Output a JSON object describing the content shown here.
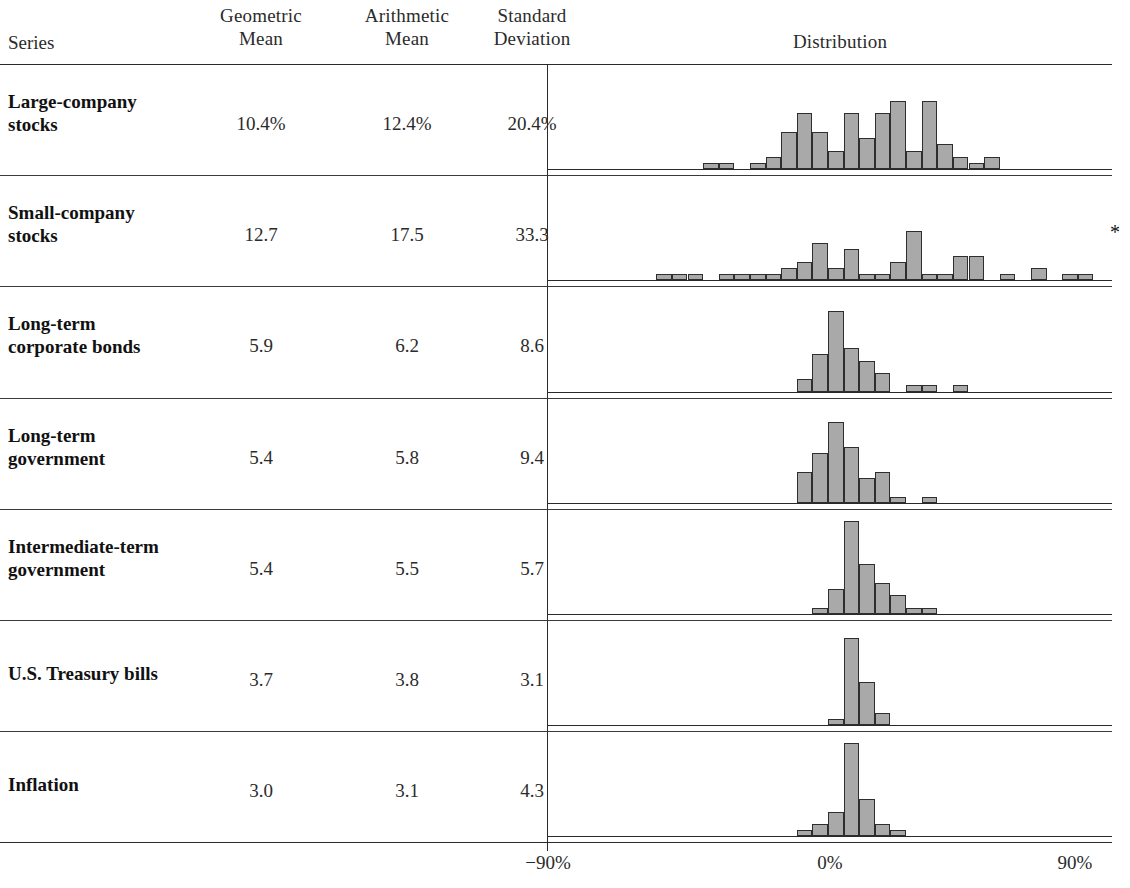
{
  "header": {
    "series_label": "Series",
    "geometric_mean": "Geometric\nMean",
    "geometric_mean_l1": "Geometric",
    "geometric_mean_l2": "Mean",
    "arithmetic_mean_l1": "Arithmetic",
    "arithmetic_mean_l2": "Mean",
    "std_dev_l1": "Standard",
    "std_dev_l2": "Deviation",
    "distribution": "Distribution"
  },
  "axis": {
    "left_label": "−90%",
    "center_label": "0%",
    "right_label": "90%",
    "min": -90,
    "max": 90
  },
  "footnote": {
    "marker": "*"
  },
  "colors": {
    "bar_fill": "#a9a9a9",
    "bar_stroke": "#2e2e2e",
    "rule": "#2a2a2a",
    "text": "#2b2b2b"
  },
  "rows": [
    {
      "label_l1": "Large-company",
      "label_l2": "stocks",
      "geometric_mean": "10.4%",
      "arithmetic_mean": "12.4%",
      "standard_deviation": "20.4%"
    },
    {
      "label_l1": "Small-company",
      "label_l2": "stocks",
      "geometric_mean": "12.7",
      "arithmetic_mean": "17.5",
      "standard_deviation": "33.3"
    },
    {
      "label_l1": "Long-term",
      "label_l2": "corporate bonds",
      "geometric_mean": "5.9",
      "arithmetic_mean": "6.2",
      "standard_deviation": "8.6"
    },
    {
      "label_l1": "Long-term",
      "label_l2": "government",
      "geometric_mean": "5.4",
      "arithmetic_mean": "5.8",
      "standard_deviation": "9.4"
    },
    {
      "label_l1": "Intermediate-term",
      "label_l2": "government",
      "geometric_mean": "5.4",
      "arithmetic_mean": "5.5",
      "standard_deviation": "5.7"
    },
    {
      "label_l1": "U.S. Treasury bills",
      "label_l2": "",
      "geometric_mean": "3.7",
      "arithmetic_mean": "3.8",
      "standard_deviation": "3.1"
    },
    {
      "label_l1": "Inflation",
      "label_l2": "",
      "geometric_mean": "3.0",
      "arithmetic_mean": "3.1",
      "standard_deviation": "4.3"
    }
  ],
  "chart_data": {
    "type": "bar",
    "title": "Distribution",
    "subtitle": "Year-by-year total returns histograms, 1926–2005",
    "xlabel": "",
    "ylabel": "",
    "xlim": [
      -90,
      90
    ],
    "grid": false,
    "legend": null,
    "bin_width": 5,
    "note": "Each panel is a histogram of annual percent returns; x is return in percent, y is count of years.",
    "panels": [
      {
        "name": "Large-company stocks",
        "bins": [
          -45,
          -40,
          -35,
          -30,
          -25,
          -20,
          -15,
          -10,
          -5,
          0,
          5,
          10,
          15,
          20,
          25,
          30,
          35,
          40,
          45,
          50,
          55
        ],
        "counts": [
          0,
          1,
          1,
          0,
          1,
          2,
          6,
          9,
          6,
          3,
          9,
          5,
          9,
          11,
          3,
          11,
          4,
          2,
          1,
          2,
          0
        ]
      },
      {
        "name": "Small-company stocks",
        "bins": [
          -60,
          -55,
          -50,
          -45,
          -40,
          -35,
          -30,
          -25,
          -20,
          -15,
          -10,
          -5,
          0,
          5,
          10,
          15,
          20,
          25,
          30,
          35,
          40,
          45,
          50,
          55,
          60,
          65,
          70,
          75,
          80,
          85
        ],
        "counts": [
          0,
          1,
          1,
          1,
          0,
          1,
          1,
          1,
          1,
          2,
          3,
          6,
          2,
          5,
          1,
          1,
          3,
          8,
          1,
          1,
          4,
          4,
          0,
          1,
          0,
          2,
          0,
          1,
          1,
          0
        ]
      },
      {
        "name": "Long-term corporate bonds",
        "bins": [
          -15,
          -10,
          -5,
          0,
          5,
          10,
          15,
          20,
          25,
          30,
          35,
          40
        ],
        "counts": [
          0,
          2,
          6,
          13,
          7,
          5,
          3,
          0,
          1,
          1,
          0,
          1
        ]
      },
      {
        "name": "Long-term government",
        "bins": [
          -15,
          -10,
          -5,
          0,
          5,
          10,
          15,
          20,
          25,
          30,
          35,
          40
        ],
        "counts": [
          0,
          5,
          8,
          13,
          9,
          4,
          5,
          1,
          0,
          1,
          0,
          0
        ]
      },
      {
        "name": "Intermediate-term government",
        "bins": [
          -10,
          -5,
          0,
          5,
          10,
          15,
          20,
          25,
          30
        ],
        "counts": [
          0,
          1,
          4,
          15,
          8,
          5,
          3,
          1,
          1
        ]
      },
      {
        "name": "U.S. Treasury bills",
        "bins": [
          -5,
          0,
          5,
          10,
          15
        ],
        "counts": [
          0,
          1,
          14,
          7,
          2
        ]
      },
      {
        "name": "Inflation",
        "bins": [
          -15,
          -10,
          -5,
          0,
          5,
          10,
          15,
          20
        ],
        "counts": [
          0,
          1,
          2,
          4,
          15,
          6,
          2,
          1
        ]
      }
    ]
  }
}
